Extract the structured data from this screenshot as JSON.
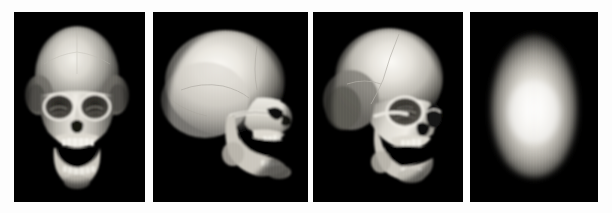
{
  "figure": {
    "background_color": "#fdfdfd",
    "panel_background_color": "#000000",
    "bone_color": "#e8e6e0",
    "panel_count": 4,
    "modality": "3D volume-rendered CT reconstruction",
    "colormap": "grayscale"
  },
  "panels": [
    {
      "id": "panel-1",
      "view": "anterior",
      "view_label": "frontal view",
      "description": "Frontal view of skull showing orbits, nasal aperture, maxilla and mandible with open jaw and visible dentition",
      "x": 14,
      "y": 12,
      "width": 131,
      "height": 190
    },
    {
      "id": "panel-2",
      "view": "lateral",
      "view_label": "lateral profile view",
      "description": "Right lateral profile of skull facing right, showing calvaria, coronal and squamosal sutures, zygomatic arch and open mandible",
      "x": 153,
      "y": 12,
      "width": 155,
      "height": 190
    },
    {
      "id": "panel-3",
      "view": "oblique",
      "view_label": "three-quarter oblique view",
      "description": "Three-quarter oblique view of skull showing coronal suture, orbital rims, zygomatic bone and open mandible with teeth",
      "x": 313,
      "y": 12,
      "width": 150,
      "height": 190
    },
    {
      "id": "panel-4",
      "view": "superior",
      "view_label": "superior vertex view",
      "description": "Top-down superior view of cranial vault with faint sagittal and lambdoid sutures",
      "x": 470,
      "y": 12,
      "width": 128,
      "height": 190
    }
  ]
}
